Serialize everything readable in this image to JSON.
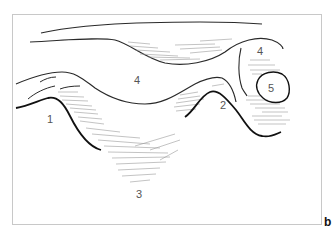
{
  "figure": {
    "panel_label": "b",
    "frame_color": "#c8c8c8",
    "outline_color": "#2a2a2a",
    "bold_color": "#111111",
    "hatch_color": "#9a9a9a",
    "labels": [
      {
        "id": "1",
        "text": "1"
      },
      {
        "id": "2",
        "text": "2"
      },
      {
        "id": "3",
        "text": "3"
      },
      {
        "id": "4a",
        "text": "4"
      },
      {
        "id": "4b",
        "text": "4"
      },
      {
        "id": "5",
        "text": "5"
      }
    ]
  }
}
